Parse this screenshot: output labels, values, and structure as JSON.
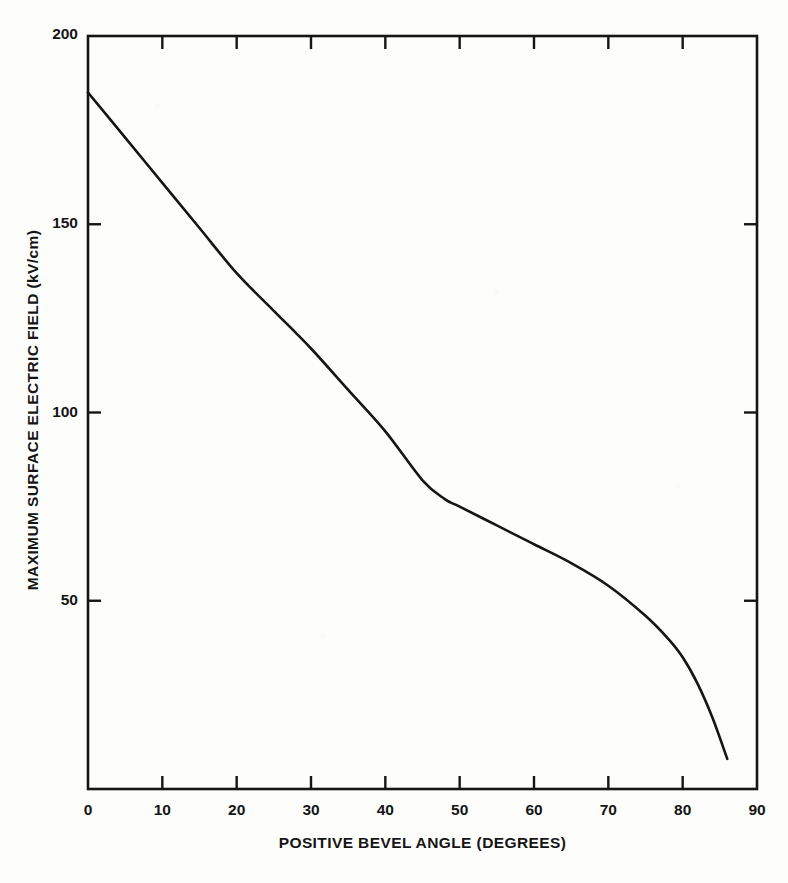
{
  "figure": {
    "background_color": "#fdfdfc",
    "ink_color": "#151515",
    "caption_fragment": ""
  },
  "chart_data": {
    "type": "line",
    "title": "",
    "subtitle": "",
    "xlabel": "POSITIVE BEVEL ANGLE (DEGREES)",
    "ylabel": "MAXIMUM SURFACE ELECTRIC FIELD (kV/cm)",
    "xlim": [
      0,
      90
    ],
    "ylim": [
      0,
      200
    ],
    "xticks": [
      0,
      10,
      20,
      30,
      40,
      50,
      60,
      70,
      80,
      90
    ],
    "yticks": [
      50,
      100,
      150,
      200
    ],
    "xtick_labels": [
      "0",
      "10",
      "20",
      "30",
      "40",
      "50",
      "60",
      "70",
      "80",
      "90"
    ],
    "ytick_labels": [
      "50",
      "100",
      "150",
      "200"
    ],
    "grid": false,
    "legend": null,
    "legend_position": "none",
    "ticks_all_sides": true,
    "line_color": "#151515",
    "line_width": 2.6,
    "series": [
      {
        "name": "maximum surface electric field",
        "x": [
          0,
          5,
          10,
          15,
          20,
          25,
          30,
          35,
          40,
          45,
          48,
          50,
          55,
          60,
          65,
          70,
          75,
          78,
          80,
          82,
          84,
          86
        ],
        "y": [
          185,
          173,
          161,
          149,
          137,
          127,
          117,
          106,
          95,
          82,
          77,
          75,
          70,
          65,
          60,
          54,
          46,
          40,
          35,
          28,
          19,
          8
        ]
      }
    ]
  }
}
